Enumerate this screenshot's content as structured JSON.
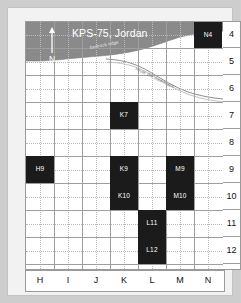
{
  "map": {
    "title": "KPS-75, Jordan",
    "north_label": "N",
    "annotations": [
      {
        "text": "bedrock ridge",
        "kind": "terrain"
      },
      {
        "text": "route the wadi/track",
        "kind": "route"
      }
    ],
    "columns": [
      "H",
      "I",
      "J",
      "K",
      "L",
      "M",
      "N"
    ],
    "rows": [
      "4",
      "5",
      "6",
      "7",
      "8",
      "9",
      "10",
      "11",
      "12"
    ],
    "squares": [
      {
        "id": "N4",
        "col": "N",
        "row": "4"
      },
      {
        "id": "K7",
        "col": "K",
        "row": "7"
      },
      {
        "id": "H9",
        "col": "H",
        "row": "9"
      },
      {
        "id": "K9",
        "col": "K",
        "row": "9"
      },
      {
        "id": "M9",
        "col": "M",
        "row": "9"
      },
      {
        "id": "K10",
        "col": "K",
        "row": "10"
      },
      {
        "id": "M10",
        "col": "M",
        "row": "10"
      },
      {
        "id": "L11",
        "col": "L",
        "row": "11"
      },
      {
        "id": "L12",
        "col": "L",
        "row": "12"
      }
    ],
    "colors": {
      "excavated_square": "#1b1b1b",
      "bedrock": "#8a8a8a",
      "grid_line": "#9e9e9e",
      "minor_grid_line": "#b9b9b9",
      "background": "#cdcdcd",
      "plate": "#f2f2f2"
    }
  }
}
